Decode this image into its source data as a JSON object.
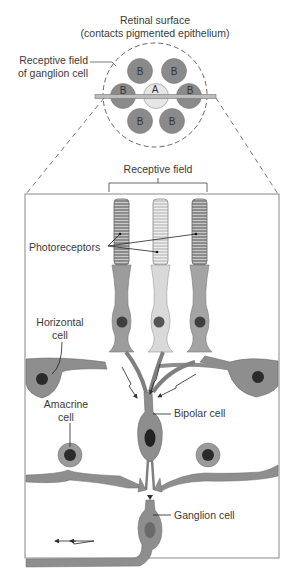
{
  "figure": {
    "top_panel": {
      "title_line1": "Retinal surface",
      "title_line2": "(contacts pigmented epithelium)",
      "receptive_field_label_line1": "Receptive field",
      "receptive_field_label_line2": "of ganglion cell",
      "center_cell_label": "A",
      "surround_cell_label": "B",
      "surround_count": 6
    },
    "bottom_panel": {
      "receptive_field_label": "Receptive field",
      "labels": {
        "photoreceptors": "Photoreceptors",
        "horizontal_cell_line1": "Horizontal",
        "horizontal_cell_line2": "cell",
        "amacrine_cell_line1": "Amacrine",
        "amacrine_cell_line2": "cell",
        "bipolar_cell": "Bipolar cell",
        "ganglion_cell": "Ganglion cell"
      }
    },
    "colors": {
      "dark_cell": "#8a8a8a",
      "light_cell": "#d8d8d8",
      "mid_cell": "#a6a6a6",
      "nucleus": "#2e2e2e",
      "outline": "#6a6a6a",
      "line": "#3a3a3a"
    }
  }
}
